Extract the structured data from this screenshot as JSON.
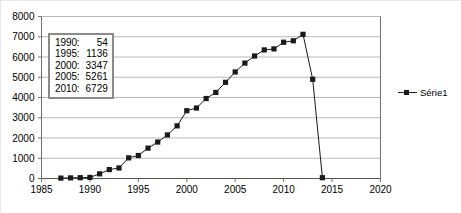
{
  "chart_data": {
    "type": "line",
    "title": "",
    "xlabel": "",
    "ylabel": "",
    "xlim": [
      1985,
      2020
    ],
    "ylim": [
      0,
      8000
    ],
    "xticks": [
      1985,
      1990,
      1995,
      2000,
      2005,
      2010,
      2015,
      2020
    ],
    "yticks": [
      0,
      1000,
      2000,
      3000,
      4000,
      5000,
      6000,
      7000,
      8000
    ],
    "grid": true,
    "legend_position": "right",
    "marker": "square",
    "series": [
      {
        "name": "Série1",
        "color": "#1a1a1a",
        "x": [
          1987,
          1988,
          1989,
          1990,
          1991,
          1992,
          1993,
          1994,
          1995,
          1996,
          1997,
          1998,
          1999,
          2000,
          2001,
          2002,
          2003,
          2004,
          2005,
          2006,
          2007,
          2008,
          2009,
          2010,
          2011,
          2012,
          2013,
          2014
        ],
        "values": [
          20,
          30,
          40,
          54,
          230,
          440,
          520,
          1020,
          1136,
          1500,
          1800,
          2150,
          2600,
          3347,
          3480,
          3950,
          4250,
          4750,
          5261,
          5700,
          6050,
          6350,
          6400,
          6729,
          6800,
          7120,
          4900,
          40
        ]
      }
    ]
  },
  "value_box": {
    "rows": [
      {
        "key": "1990:",
        "value": "54"
      },
      {
        "key": "1995:",
        "value": "1136"
      },
      {
        "key": "2000:",
        "value": "3347"
      },
      {
        "key": "2005:",
        "value": "5261"
      },
      {
        "key": "2010:",
        "value": "6729"
      }
    ]
  },
  "legend": {
    "entries": [
      {
        "label": "Série1"
      }
    ]
  },
  "colors": {
    "series": "#1a1a1a",
    "gridline": "#b9b9b9",
    "axis": "#707070",
    "box_border": "#8a8a8a",
    "background": "#ffffff"
  }
}
